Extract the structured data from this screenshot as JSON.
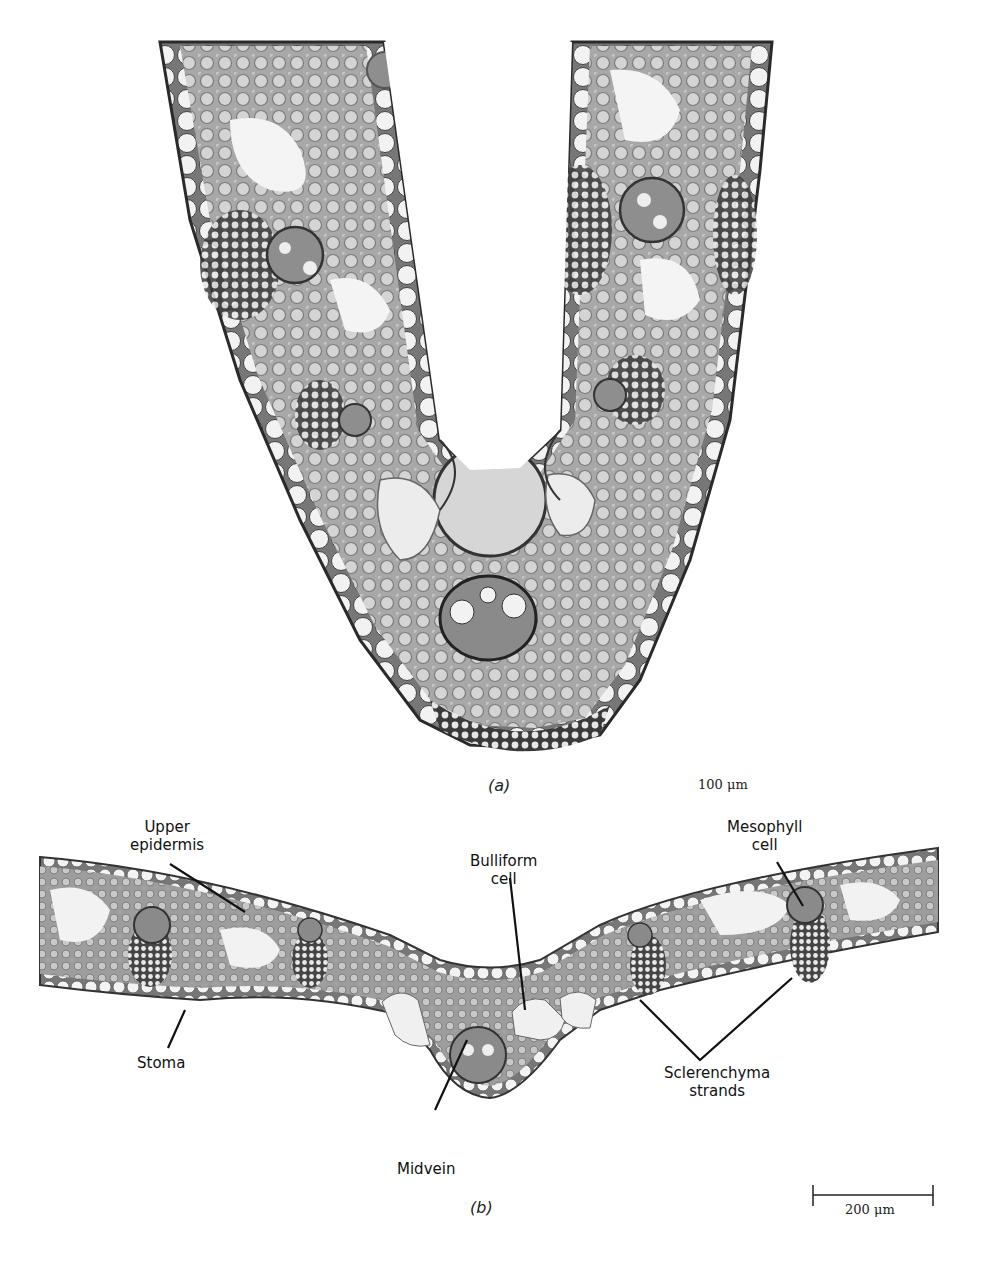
{
  "figure": {
    "panel_a": {
      "letter": "(a)",
      "scale_bar": {
        "label": "100 μm"
      }
    },
    "panel_b": {
      "letter": "(b)",
      "scale_bar": {
        "label": "200 μm"
      },
      "labels": {
        "upper_epidermis": [
          "Upper",
          "epidermis"
        ],
        "bulliform_cell": [
          "Bulliform",
          "cell"
        ],
        "mesophyll_cell": [
          "Mesophyll",
          "cell"
        ],
        "stoma": [
          "Stoma"
        ],
        "sclerenchyma_strands": [
          "Sclerenchyma",
          "strands"
        ],
        "midvein": [
          "Midvein"
        ]
      }
    },
    "colors": {
      "tissue": "#a9a9a9",
      "tissue_dark": "#555555",
      "cell_fill": "#efefef",
      "outline": "#2a2a2a",
      "leader_line": "#111111"
    }
  }
}
